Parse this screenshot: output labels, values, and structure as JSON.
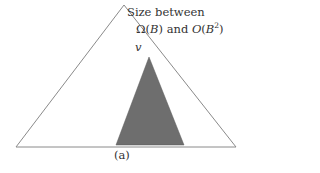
{
  "figure": {
    "caption": "(a)",
    "outer_triangle": {
      "apex": [
        124,
        5
      ],
      "bottom_left": [
        16,
        147
      ],
      "bottom_right": [
        236,
        147
      ],
      "stroke": "#8a8a8a",
      "fill": "#ffffff"
    },
    "inner_triangle": {
      "apex": [
        149,
        57
      ],
      "bottom_left": [
        116,
        145
      ],
      "bottom_right": [
        184,
        145
      ],
      "fill": "#6e6e6e"
    },
    "vertex_label": "v",
    "annotation": {
      "line1": "Size between",
      "line2": {
        "omega": "Ω(",
        "omega_arg": "B",
        "omega_close": ")",
        "and": " and ",
        "big_o": "O",
        "big_o_open": "(",
        "big_o_arg": "B",
        "exponent": "2",
        "big_o_close": ")"
      }
    }
  }
}
